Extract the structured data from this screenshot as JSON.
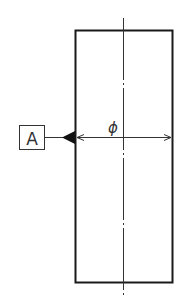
{
  "diagram": {
    "type": "engineering-drawing",
    "datum_label": "A",
    "dimension_symbol": "ϕ",
    "colors": {
      "line": "#1a1a1a",
      "background": "#ffffff"
    }
  }
}
